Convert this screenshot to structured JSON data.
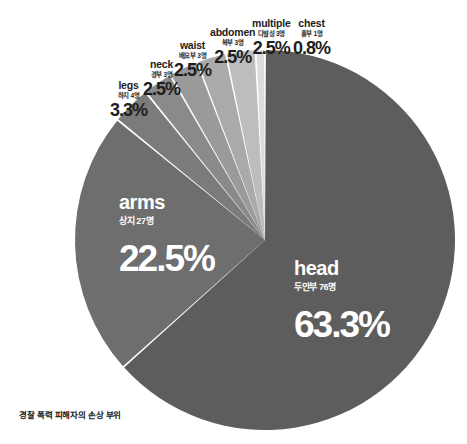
{
  "caption": "경찰 폭력 피해자의 손상 부위",
  "chart_data": {
    "type": "pie",
    "title": "경찰 폭력 피해자의 손상 부위",
    "total_label": "120명",
    "start_angle_deg": 0,
    "direction": "clockwise",
    "legend": "none-inline-labels",
    "slices": [
      {
        "label": "head",
        "label_kr": "두안부 76명",
        "count": 76,
        "value": 63.3,
        "pct_label": "63.3%",
        "color": "#5d5d5d",
        "placement": "inside"
      },
      {
        "label": "arms",
        "label_kr": "상지 27명",
        "count": 27,
        "value": 22.5,
        "pct_label": "22.5%",
        "color": "#6e6e6e",
        "placement": "inside"
      },
      {
        "label": "legs",
        "label_kr": "하지 4명",
        "count": 4,
        "value": 3.3,
        "pct_label": "3.3%",
        "color": "#7b7b7b",
        "placement": "outside"
      },
      {
        "label": "neck",
        "label_kr": "경부 3명",
        "count": 3,
        "value": 2.5,
        "pct_label": "2.5%",
        "color": "#8a8a8a",
        "placement": "outside"
      },
      {
        "label": "waist",
        "label_kr": "배요부 3명",
        "count": 3,
        "value": 2.5,
        "pct_label": "2.5%",
        "color": "#9a9a9a",
        "placement": "outside"
      },
      {
        "label": "abdomen",
        "label_kr": "복부 3명",
        "count": 3,
        "value": 2.5,
        "pct_label": "2.5%",
        "color": "#aaaaaa",
        "placement": "outside"
      },
      {
        "label": "multiple",
        "label_kr": "다발성 3명",
        "count": 3,
        "value": 2.5,
        "pct_label": "2.5%",
        "color": "#bdbdbd",
        "placement": "outside"
      },
      {
        "label": "chest",
        "label_kr": "흉부 1명",
        "count": 1,
        "value": 0.8,
        "pct_label": "0.8%",
        "color": "#dcdcdc",
        "placement": "outside"
      }
    ],
    "geometry": {
      "cx": 265,
      "cy": 240,
      "r": 190
    },
    "background": "#ffffff"
  }
}
